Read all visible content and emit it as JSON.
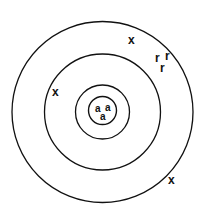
{
  "diagram": {
    "type": "bohr-atomic-shell-diagram",
    "title": "",
    "background_color": "#ffffff",
    "stroke_color": "#111111",
    "text_color": "#111111",
    "center": {
      "x": 102.5,
      "y": 112
    },
    "shells": [
      {
        "name": "nucleus-circle",
        "radius": 14,
        "stroke_width": 1.4
      },
      {
        "name": "inner-shell-circle",
        "radius": 27,
        "stroke_width": 1.3
      },
      {
        "name": "middle-shell-circle",
        "radius": 58,
        "stroke_width": 1.3
      },
      {
        "name": "outer-shell-circle",
        "radius": 90.5,
        "stroke_width": 1.3
      }
    ],
    "nucleus_particles": [
      {
        "label": "a",
        "x": 96,
        "y": 105
      },
      {
        "label": "a",
        "x": 106,
        "y": 104
      },
      {
        "label": "a",
        "x": 101,
        "y": 113
      }
    ],
    "shell_electrons": [
      {
        "label": "x",
        "x": 129,
        "y": 34
      },
      {
        "label": "x",
        "x": 53,
        "y": 86
      },
      {
        "label": "x",
        "x": 169,
        "y": 174
      }
    ],
    "radius_labels": [
      {
        "label": "r",
        "x": 156,
        "y": 52
      },
      {
        "label": "r",
        "x": 166,
        "y": 50
      },
      {
        "label": "r",
        "x": 161,
        "y": 62
      }
    ]
  }
}
